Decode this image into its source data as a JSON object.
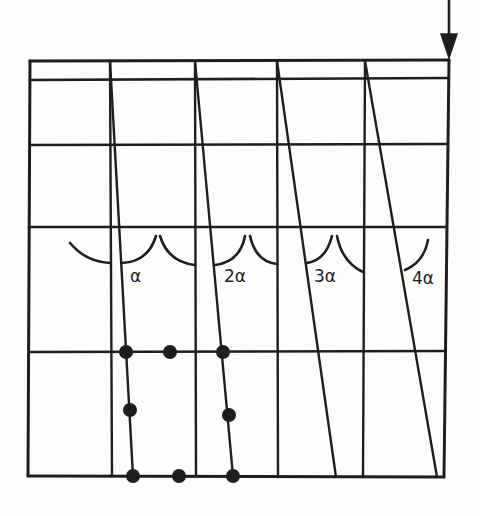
{
  "figure": {
    "type": "grid-shear-diagram",
    "colors": {
      "ink": "#1e1e1e",
      "background": "#fdfdfc"
    },
    "load_arrow": {
      "label": "",
      "direction": "down"
    },
    "angle_labels": [
      {
        "id": "a1",
        "text": "α"
      },
      {
        "id": "a2",
        "text": "2α"
      },
      {
        "id": "a3",
        "text": "3α"
      },
      {
        "id": "a4",
        "text": "4α"
      }
    ],
    "grid": {
      "columns": 5,
      "horizontal_lines": 5,
      "diagonals": 4
    },
    "nodes": {
      "count": 8,
      "rows": [
        {
          "row": "top",
          "count": 3
        },
        {
          "row": "middle",
          "count": 2
        },
        {
          "row": "bottom",
          "count": 3
        }
      ]
    }
  }
}
